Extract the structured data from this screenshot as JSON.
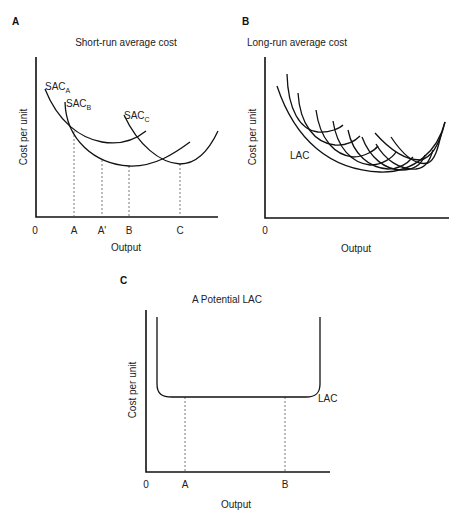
{
  "panels": {
    "a": {
      "letter": "A",
      "title": "Short-run average cost",
      "ylabel": "Cost per unit",
      "xlabel": "Output",
      "origin": "0",
      "ticks": [
        "A",
        "A'",
        "B",
        "C"
      ],
      "curves": {
        "sac_a": {
          "base": "SAC",
          "sub": "A"
        },
        "sac_b": {
          "base": "SAC",
          "sub": "B"
        },
        "sac_c": {
          "base": "SAC",
          "sub": "C"
        }
      }
    },
    "b": {
      "letter": "B",
      "title": "Long-run average cost",
      "ylabel": "Cost per unit",
      "xlabel": "Output",
      "origin": "0",
      "curve_label": "LAC"
    },
    "c": {
      "letter": "C",
      "title": "A Potential LAC",
      "ylabel": "Cost per unit",
      "xlabel": "Output",
      "origin": "0",
      "ticks": [
        "A",
        "B"
      ],
      "curve_label": "LAC"
    }
  },
  "colors": {
    "line": "#111111",
    "dashed": "#555555",
    "background": "#ffffff"
  }
}
